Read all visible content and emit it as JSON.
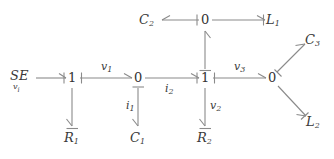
{
  "diagram": {
    "stroke_color": "#808080",
    "text_color": "#3a3a3a",
    "background": "#ffffff",
    "width": 334,
    "height": 159
  },
  "source": {
    "name": "SE",
    "subscript": "v",
    "subscript2": "i"
  },
  "junctions": {
    "j1_one": "1",
    "j2_zero": "0",
    "j3_one": "1",
    "j4_zero": "0",
    "j5_zero_top": "0"
  },
  "elements": {
    "r1": "R",
    "r1_sub": "1",
    "c1": "C",
    "c1_sub": "1",
    "r2": "R",
    "r2_sub": "2",
    "c2": "C",
    "c2_sub": "2",
    "l1": "L",
    "l1_sub": "1",
    "c3": "C",
    "c3_sub": "3",
    "l2": "L",
    "l2_sub": "2"
  },
  "bonds": {
    "v1": "v",
    "v1_sub": "1",
    "i2": "i",
    "i2_sub": "2",
    "v3": "v",
    "v3_sub": "3",
    "i1": "i",
    "i1_sub": "1",
    "v2": "v",
    "v2_sub": "2"
  }
}
